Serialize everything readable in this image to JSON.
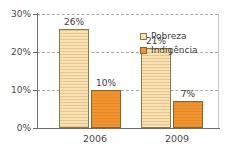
{
  "chart_data": {
    "type": "bar",
    "title": "",
    "subtitle": "",
    "xlabel": "",
    "ylabel": "",
    "categories": [
      "2006",
      "2009"
    ],
    "series": [
      {
        "name": "Pobreza",
        "values": [
          26,
          10
        ]
      },
      {
        "name": "Indigência",
        "values": [
          21,
          7
        ]
      }
    ],
    "series_display": [
      {
        "name": "Pobreza",
        "color": "#f8e2b4",
        "border": "#8a7c4e",
        "values": [
          26,
          21
        ],
        "labels": [
          "26%",
          "21%"
        ]
      },
      {
        "name": "Indigência",
        "color": "#f2932e",
        "border": "#8a6526",
        "values": [
          10,
          7
        ],
        "labels": [
          "10%",
          "7%"
        ]
      }
    ],
    "ylim": [
      0,
      30
    ],
    "yticks": [
      0,
      10,
      20,
      30
    ],
    "ytick_labels": [
      "0%",
      "10%",
      "20%",
      "30%"
    ],
    "grid": true,
    "grid_style": "dashed",
    "grid_color": "#a8a8a8",
    "legend_position": "top-right",
    "value_labels_shown": true,
    "annotations": []
  },
  "axes": {
    "y": {
      "ticks": [
        {
          "label": "30%",
          "value": 30
        },
        {
          "label": "20%",
          "value": 20
        },
        {
          "label": "10%",
          "value": 10
        },
        {
          "label": "0%",
          "value": 0
        }
      ]
    },
    "x": {
      "ticks": [
        {
          "label": "2006"
        },
        {
          "label": "2009"
        }
      ]
    }
  },
  "legend": {
    "items": [
      {
        "label": "Pobreza",
        "swatch": "pobreza-swatch"
      },
      {
        "label": "Indigência",
        "swatch": "indigencia-swatch"
      }
    ]
  },
  "bars": [
    {
      "group": "2006",
      "series": "Pobreza",
      "value": 26,
      "label": "26%"
    },
    {
      "group": "2006",
      "series": "Indigência",
      "value": 10,
      "label": "10%"
    },
    {
      "group": "2009",
      "series": "Pobreza",
      "value": 21,
      "label": "21%"
    },
    {
      "group": "2009",
      "series": "Indigência",
      "value": 7,
      "label": "7%"
    }
  ],
  "colors": {
    "pobreza": "#f8e2b4",
    "pobreza_border": "#8a7c4e",
    "indigencia": "#f2932e",
    "indigencia_border": "#8a6526",
    "axis": "#6e6e6e",
    "grid": "#a8a8a8",
    "text": "#4a4a4a"
  }
}
